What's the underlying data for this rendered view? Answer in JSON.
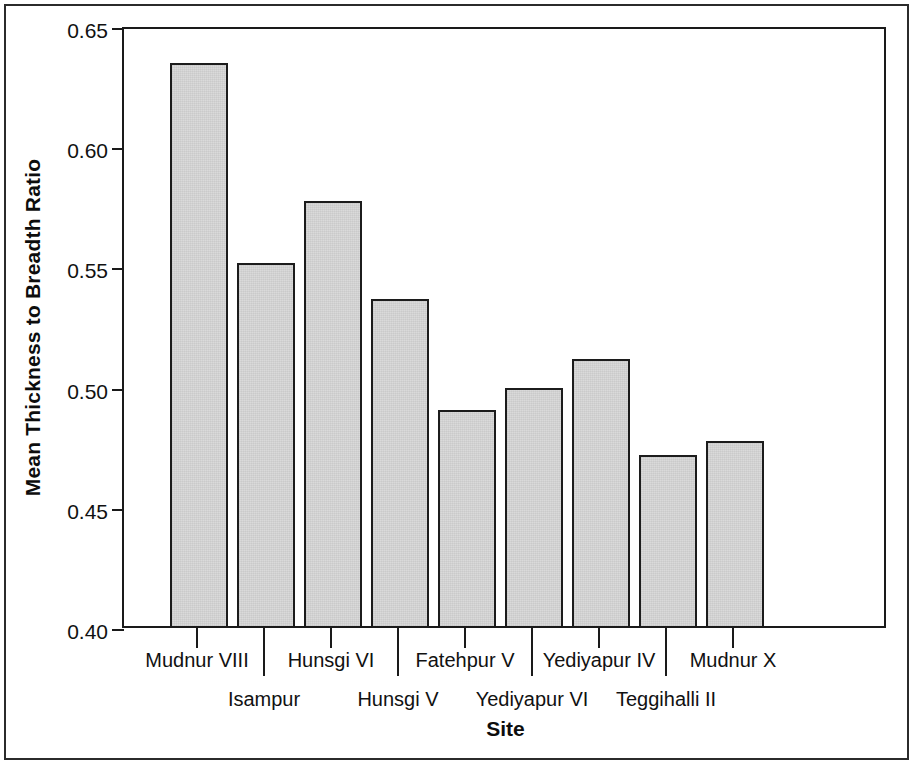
{
  "figure": {
    "background_color": "#ffffff",
    "border_color": "#2b2b2b",
    "axis_color": "#1a1a1a"
  },
  "chart_data": {
    "type": "bar",
    "title": "",
    "xlabel": "Site",
    "ylabel": "Mean Thickness to Breadth Ratio",
    "categories": [
      "Mudnur VIII",
      "Isampur",
      "Hunsgi VI",
      "Hunsgi V",
      "Fatehpur V",
      "Yediyapur VI",
      "Yediyapur IV",
      "Teggihalli II",
      "Mudnur X"
    ],
    "values": [
      0.634,
      0.551,
      0.577,
      0.536,
      0.49,
      0.499,
      0.511,
      0.471,
      0.477
    ],
    "ylim": [
      0.4,
      0.65
    ],
    "yticks": [
      "0.40",
      "0.45",
      "0.50",
      "0.55",
      "0.60",
      "0.65"
    ],
    "ytick_values": [
      0.4,
      0.45,
      0.5,
      0.55,
      0.6,
      0.65
    ],
    "grid": false,
    "legend": false,
    "bar_fill_color": "#d8d8d8",
    "bar_edge_color": "#1c1c1c",
    "label_rows": [
      1,
      2,
      1,
      2,
      1,
      2,
      1,
      2,
      1
    ]
  }
}
